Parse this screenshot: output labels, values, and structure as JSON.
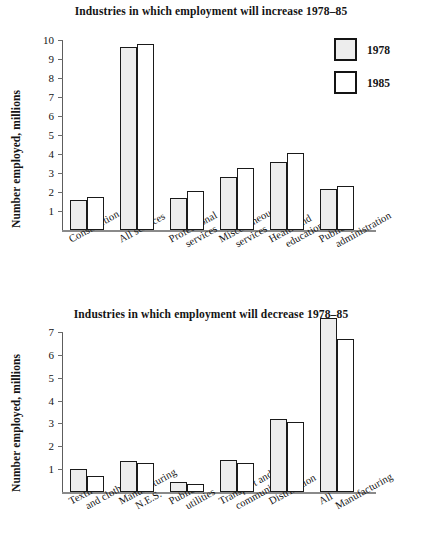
{
  "legend": {
    "entries": [
      {
        "label": "1978",
        "color": "#ededed",
        "key": "s1978"
      },
      {
        "label": "1985",
        "color": "#ffffff",
        "key": "s1985"
      }
    ]
  },
  "axis_label": "Number employed, millions",
  "chart_data": [
    {
      "type": "bar",
      "title": "Industries in which employment will increase 1978–85",
      "xlabel": "",
      "ylabel": "Number employed, millions",
      "ylim": [
        0,
        10
      ],
      "yticks": [
        1,
        2,
        3,
        4,
        5,
        6,
        7,
        8,
        9,
        10
      ],
      "grid": false,
      "legend_position": "top-right",
      "categories": [
        "Construction",
        "All services",
        "Professional services",
        "Miscellaneous services",
        "Health and education",
        "Public administration"
      ],
      "category_lines": [
        [
          "Construction",
          ""
        ],
        [
          "All services",
          ""
        ],
        [
          "Professional",
          "services"
        ],
        [
          "Miscellaneous",
          "services"
        ],
        [
          "Health and",
          "education"
        ],
        [
          "Public",
          "administration"
        ]
      ],
      "series": [
        {
          "name": "1978",
          "values": [
            1.6,
            9.65,
            1.7,
            2.8,
            3.6,
            2.15
          ]
        },
        {
          "name": "1985",
          "values": [
            1.75,
            9.8,
            2.05,
            3.25,
            4.05,
            2.3
          ]
        }
      ]
    },
    {
      "type": "bar",
      "title": "Industries in which employment will decrease 1978–85",
      "xlabel": "",
      "ylabel": "Number employed, millions",
      "ylim": [
        0,
        7
      ],
      "yticks": [
        1,
        2,
        3,
        4,
        5,
        6,
        7
      ],
      "grid": false,
      "legend_position": "none",
      "categories": [
        "Textiles and clothing",
        "Manufacturing N.E.S.",
        "Public utilities",
        "Transport and communication",
        "Distribution",
        "All Manufacturing"
      ],
      "category_lines": [
        [
          "Textiles",
          "and clothing"
        ],
        [
          "Manufacturing",
          "N.E.S."
        ],
        [
          "Public",
          "utilities"
        ],
        [
          "Transport and",
          "communication"
        ],
        [
          "Distribution",
          ""
        ],
        [
          "All",
          "Manufacturing"
        ]
      ],
      "series": [
        {
          "name": "1978",
          "values": [
            1.0,
            1.35,
            0.45,
            1.4,
            3.2,
            7.6
          ]
        },
        {
          "name": "1985",
          "values": [
            0.7,
            1.25,
            0.35,
            1.25,
            3.05,
            6.7
          ]
        }
      ]
    }
  ]
}
